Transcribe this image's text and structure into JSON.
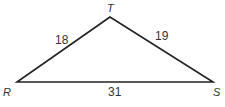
{
  "figure": {
    "type": "triangle",
    "vertices": [
      {
        "name": "T",
        "x": 110,
        "y": 17
      },
      {
        "name": "R",
        "x": 17,
        "y": 82
      },
      {
        "name": "S",
        "x": 213,
        "y": 82
      }
    ],
    "sides": [
      {
        "from": "R",
        "to": "T",
        "length": "18"
      },
      {
        "from": "T",
        "to": "S",
        "length": "19"
      },
      {
        "from": "R",
        "to": "S",
        "length": "31"
      }
    ],
    "stroke_color": "#222222"
  }
}
